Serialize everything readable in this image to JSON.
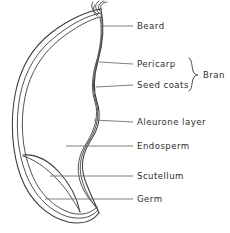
{
  "diagram": {
    "stroke_color": "#3a3a3a",
    "leader_color": "#6f6f6f",
    "text_color": "#2e2e2e",
    "background_color": "#ffffff",
    "labels": [
      {
        "id": "beard",
        "text": "Beard",
        "text_x": 137,
        "text_y": 26,
        "leader_x1": 103,
        "leader_y1": 26,
        "leader_x2": 133,
        "leader_y2": 26
      },
      {
        "id": "pericarp",
        "text": "Pericarp",
        "text_x": 137,
        "text_y": 64,
        "leader_x1": 98,
        "leader_y1": 62,
        "leader_x2": 133,
        "leader_y2": 64
      },
      {
        "id": "seed-coats",
        "text": "Seed coats",
        "text_x": 137,
        "text_y": 85,
        "leader_x1": 96,
        "leader_y1": 86,
        "leader_x2": 133,
        "leader_y2": 85
      },
      {
        "id": "aleurone-layer",
        "text": "Aleurone layer",
        "text_x": 137,
        "text_y": 122,
        "leader_x1": 94,
        "leader_y1": 120,
        "leader_x2": 133,
        "leader_y2": 122
      },
      {
        "id": "endosperm",
        "text": "Endosperm",
        "text_x": 137,
        "text_y": 146,
        "leader_x1": 66,
        "leader_y1": 146,
        "leader_x2": 133,
        "leader_y2": 146
      },
      {
        "id": "scutellum",
        "text": "Scutellum",
        "text_x": 137,
        "text_y": 176,
        "leader_x1": 50,
        "leader_y1": 176,
        "leader_x2": 133,
        "leader_y2": 176
      },
      {
        "id": "germ",
        "text": "Germ",
        "text_x": 137,
        "text_y": 199,
        "leader_x1": 45,
        "leader_y1": 199,
        "leader_x2": 133,
        "leader_y2": 199
      }
    ],
    "brace_group": {
      "id": "bran",
      "text": "Bran",
      "text_x": 205,
      "text_y": 75,
      "brace_x": 192,
      "brace_top_y": 58,
      "brace_bottom_y": 90
    },
    "outline_paths": {
      "pericarp_outer": "M 100 10 C 88 12 70 20 52 34 C 34 48 21 68 16 95 C 11 122 13 152 22 176 C 31 200 48 216 68 221 C 82 224 92 220 98 212",
      "seed_coat_mid": "M 100 14 C 89 16 72 24 55 38 C 38 51 25 70 20 96 C 15 122 17 151 26 174 C 35 197 51 212 69 217 C 82 220 91 216 97 209",
      "aleurone_inner": "M 99 18 C 90 20 74 28 58 41 C 42 54 29 72 24 97 C 19 122 21 150 30 172 C 38 194 54 208 70 213 C 82 216 90 212 96 206",
      "wavy_outer": "M 100 10 C 104 30 101 48 97 62 C 93 76 92 90 96 102 C 100 114 98 128 90 140 C 82 152 79 166 84 180 C 89 194 95 204 98 212",
      "wavy_mid": "M 100 14 C 103 32 100 49 96 63 C 92 77 91 90 95 102 C 99 114 96 129 88 141 C 80 153 77 166 81 180 C 85 194 92 203 97 209",
      "wavy_inner": "M 99 18 C 102 34 99 50 95 64 C 91 78 90 90 94 102 C 98 114 94 130 86 142 C 78 154 75 167 79 181 C 83 194 91 202 96 206",
      "scutellum_curve": "M 24 155 C 34 154 46 158 57 170 C 68 182 76 196 79 211",
      "scutellum_inner": "M 24 156 C 40 160 58 176 70 196 C 75 204 78 209 79 211",
      "beard_hairs": [
        "M 100 10 C 98 6 100 4 104 3",
        "M 99 12 C 96 7 97 4 101 2",
        "M 98 13 C 93 8 93 5 96 2",
        "M 97 14 C 91 10 89 6 91 3"
      ]
    }
  }
}
